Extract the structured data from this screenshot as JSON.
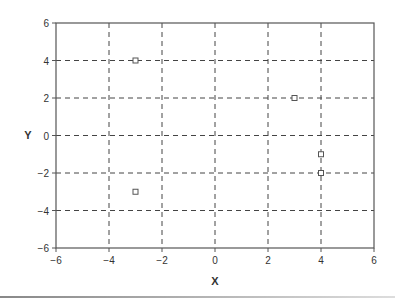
{
  "chart_data": {
    "type": "scatter",
    "title": "",
    "xlabel": "X",
    "ylabel": "Y",
    "xlim": [
      -6,
      6
    ],
    "ylim": [
      -6,
      6
    ],
    "xticks": [
      -6,
      -4,
      -2,
      0,
      2,
      4,
      6
    ],
    "yticks": [
      -6,
      -4,
      -2,
      0,
      2,
      4,
      6
    ],
    "xtick_labels": [
      "−6",
      "−4",
      "−2",
      "0",
      "2",
      "4",
      "6"
    ],
    "ytick_labels": [
      "−6",
      "−4",
      "−2",
      "0",
      "2",
      "4",
      "6"
    ],
    "grid": true,
    "grid_style": "dashed",
    "legend": null,
    "marker": "open-square",
    "series": [
      {
        "name": "points",
        "points": [
          {
            "x": -3,
            "y": 4
          },
          {
            "x": 3,
            "y": 2
          },
          {
            "x": 4,
            "y": -1
          },
          {
            "x": 4,
            "y": -2
          },
          {
            "x": -3,
            "y": -3
          }
        ]
      }
    ]
  },
  "colors": {
    "axis": "#555555",
    "grid": "#444444",
    "marker": "#555555",
    "text": "#333333"
  }
}
